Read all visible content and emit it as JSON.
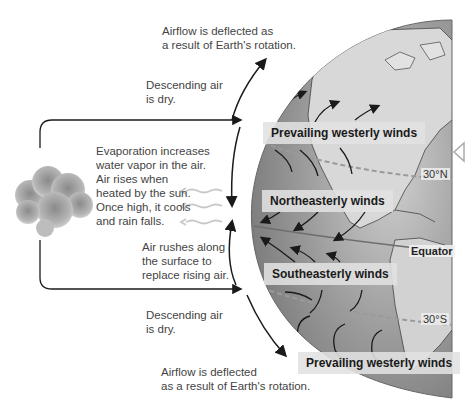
{
  "diagram": {
    "annotations": {
      "deflection_top": [
        "Airflow is deflected as",
        "a result of Earth's rotation."
      ],
      "descending_top": [
        "Descending air",
        "is dry."
      ],
      "evaporation": [
        "Evaporation increases",
        "water vapor in the air.",
        "Air rises when",
        "heated by the sun.",
        "Once high, it cools",
        "and rain falls."
      ],
      "surface": [
        "Air rushes along",
        "the surface to",
        "replace rising air."
      ],
      "descending_bottom": [
        "Descending air",
        "is dry."
      ],
      "deflection_bottom": [
        "Airflow is deflected",
        "as a result of Earth's rotation."
      ]
    },
    "wind_labels": {
      "prevailing_north": "Prevailing westerly winds",
      "northeasterly": "Northeasterly winds",
      "southeasterly": "Southeasterly winds",
      "prevailing_south": "Prevailing westerly winds"
    },
    "latitudes": {
      "north": "30°N",
      "equator": "Equator",
      "south": "30°S"
    },
    "icons": {
      "cloud": "cloud-icon",
      "nav": "triangle-left-icon"
    },
    "colors": {
      "globe_ocean": "#8f8f8f",
      "globe_land": "#d9d9d9",
      "label_bg": "#e1e1e1",
      "arrow": "#1a1a1a",
      "latitude_line": "#9a9a9a"
    }
  }
}
